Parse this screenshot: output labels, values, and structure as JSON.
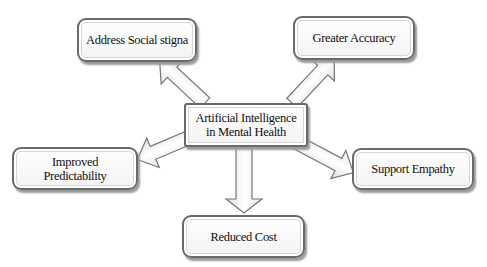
{
  "diagram": {
    "center": {
      "label_line1": "Artificial Intelligence",
      "label_line2": "in Mental Health"
    },
    "nodes": [
      {
        "id": "address",
        "label": "Address Social stigna"
      },
      {
        "id": "accuracy",
        "label": "Greater Accuracy"
      },
      {
        "id": "predictability",
        "label_line1": "Improved",
        "label_line2": "Predictability"
      },
      {
        "id": "empathy",
        "label": "Support Empathy"
      },
      {
        "id": "cost",
        "label": "Reduced Cost"
      }
    ],
    "colors": {
      "border": "#6a6a6a",
      "arrow_fill": "#f2f2f2",
      "arrow_stroke": "#777777"
    }
  }
}
